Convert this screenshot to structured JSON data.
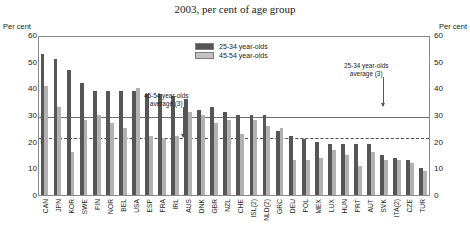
{
  "title": "2003, per cent of age group",
  "axis_label_left": "Per cent",
  "axis_label_right": "Per cent",
  "legend": [
    {
      "label": "25-34 year-olds",
      "color": "#565656"
    },
    {
      "label": "45-54 year-olds",
      "color": "#b2b2b2"
    }
  ],
  "annotations": [
    {
      "name": "avg-25-34",
      "text_line1": "25-34 year-olds",
      "text_line2": "average (3)",
      "value": 30
    },
    {
      "name": "avg-45-54",
      "text_line1": "45-54 year-olds",
      "text_line2": "average (3)",
      "value": 22
    }
  ],
  "chart_data": {
    "type": "bar",
    "title": "2003, per cent of age group",
    "xlabel": "",
    "ylabel": "Per cent",
    "ylim": [
      0,
      60
    ],
    "yticks": [
      0,
      10,
      20,
      30,
      40,
      50,
      60
    ],
    "grid": false,
    "legend_position": "top-center",
    "categories": [
      "CAN",
      "JPN",
      "KOR",
      "SWE",
      "FIN",
      "NOR",
      "BEL",
      "USA",
      "ESP",
      "FRA",
      "IRL",
      "AUS",
      "DNK",
      "GBR",
      "NZL",
      "CHE",
      "ISL(2)",
      "NLD(2)",
      "GRC",
      "DEU",
      "POL",
      "MEX",
      "LUX",
      "HUN",
      "PRT",
      "AUT",
      "SVK",
      "ITA(2)",
      "CZE",
      "TUR"
    ],
    "series": [
      {
        "name": "25-34 year-olds",
        "color": "#565656",
        "values": [
          53,
          51,
          47,
          42,
          39,
          39,
          39,
          39,
          38,
          38,
          37,
          36,
          32,
          33,
          31,
          30,
          30,
          30,
          24,
          22,
          21,
          20,
          19,
          19,
          19,
          19,
          15,
          14,
          13,
          10
        ]
      },
      {
        "name": "45-54 year-olds",
        "color": "#b2b2b2",
        "values": [
          41,
          33,
          16,
          28,
          30,
          27,
          25,
          40,
          22,
          21,
          22,
          31,
          30,
          27,
          28,
          23,
          28,
          26,
          25,
          13,
          13,
          14,
          17,
          15,
          11,
          16,
          13,
          13,
          12,
          9
        ]
      }
    ],
    "reference_lines": [
      {
        "name": "25-34 year-olds average (3)",
        "value": 30,
        "style": "solid"
      },
      {
        "name": "45-54 year-olds average (3)",
        "value": 22,
        "style": "dashed"
      }
    ]
  }
}
